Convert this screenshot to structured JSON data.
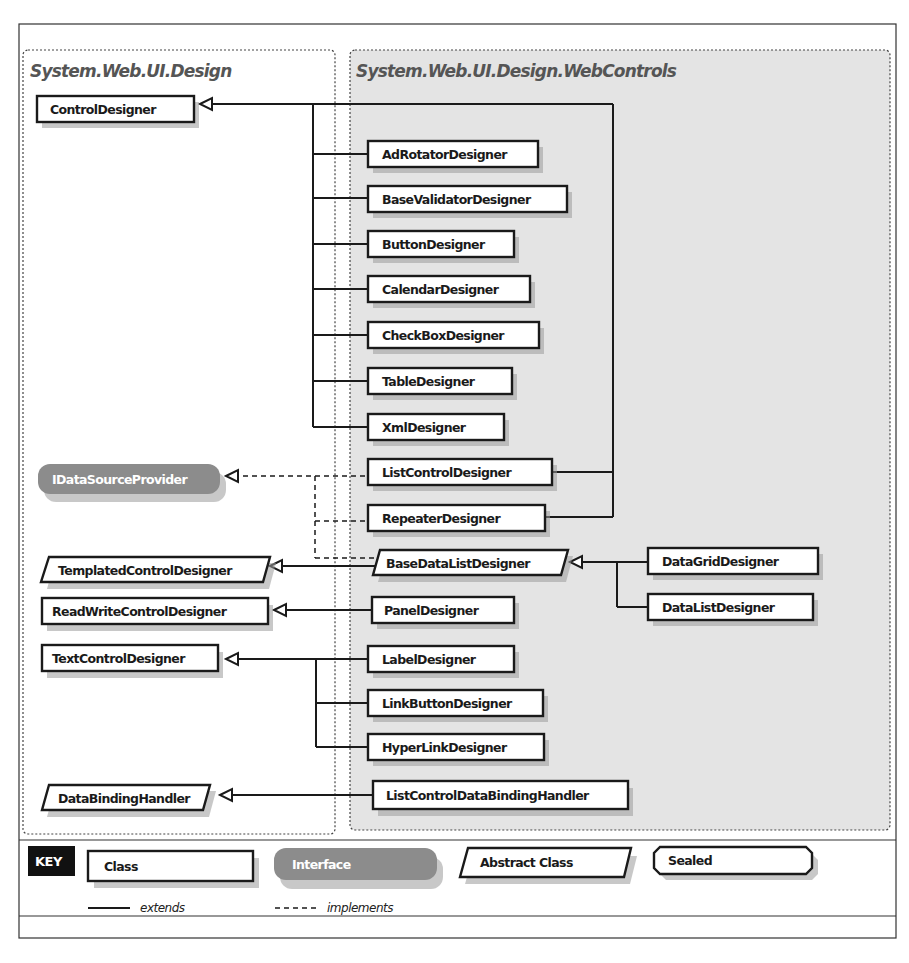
{
  "packages": {
    "left": {
      "title": "System.Web.UI.Design"
    },
    "right": {
      "title": "System.Web.UI.Design.WebControls"
    }
  },
  "classes": {
    "control_designer": "ControlDesigner",
    "ad_rotator_designer": "AdRotatorDesigner",
    "base_validator_designer": "BaseValidatorDesigner",
    "button_designer": "ButtonDesigner",
    "calendar_designer": "CalendarDesigner",
    "checkbox_designer": "CheckBoxDesigner",
    "table_designer": "TableDesigner",
    "xml_designer": "XmlDesigner",
    "idatasource_provider": "IDataSourceProvider",
    "list_control_designer": "ListControlDesigner",
    "repeater_designer": "RepeaterDesigner",
    "templated_control_designer": "TemplatedControlDesigner",
    "base_data_list_designer": "BaseDataListDesigner",
    "data_grid_designer": "DataGridDesigner",
    "data_list_designer": "DataListDesigner",
    "read_write_control_designer": "ReadWriteControlDesigner",
    "panel_designer": "PanelDesigner",
    "text_control_designer": "TextControlDesigner",
    "label_designer": "LabelDesigner",
    "link_button_designer": "LinkButtonDesigner",
    "hyperlink_designer": "HyperLinkDesigner",
    "data_binding_handler": "DataBindingHandler",
    "list_control_data_binding_handler": "ListControlDataBindingHandler"
  },
  "key": {
    "title": "KEY",
    "class": "Class",
    "interface": "Interface",
    "abstract_class": "Abstract Class",
    "sealed": "Sealed",
    "extends": "extends",
    "implements": "implements"
  },
  "colors": {
    "right_package_fill": "#e4e4e4",
    "interface_fill": "#8c8c8c",
    "key_badge": "#111111"
  }
}
